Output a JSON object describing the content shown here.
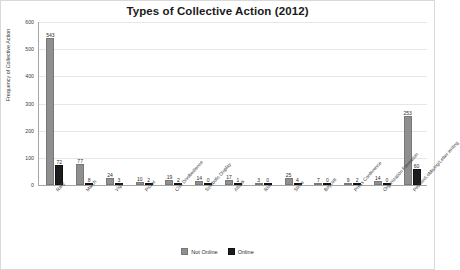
{
  "chart_data": {
    "type": "bar",
    "title": "Types of Collective Action (2012)",
    "xlabel": "",
    "ylabel": "Frequency of Collective Action",
    "ylim": [
      0,
      600
    ],
    "yticks": [
      0,
      100,
      200,
      300,
      400,
      500,
      600
    ],
    "grid": true,
    "legend_position": "bottom",
    "categories": [
      "Rally",
      "March",
      "Vigil",
      "Picket",
      "Civil Disobedience",
      "Symbolic Display",
      "Attack",
      "Riot",
      "Strike",
      "Boycott",
      "Press Conference",
      "Organization Formation",
      "Petition/Lobbying/Letter writing"
    ],
    "series": [
      {
        "name": "Not Online",
        "color": "#8f8f8f",
        "values": [
          543,
          77,
          24,
          10,
          19,
          14,
          17,
          3,
          25,
          7,
          9,
          14,
          253
        ]
      },
      {
        "name": "Online",
        "color": "#1c1c1c",
        "values": [
          72,
          8,
          3,
          2,
          2,
          0,
          1,
          0,
          4,
          0,
          2,
          0,
          60
        ]
      }
    ]
  }
}
